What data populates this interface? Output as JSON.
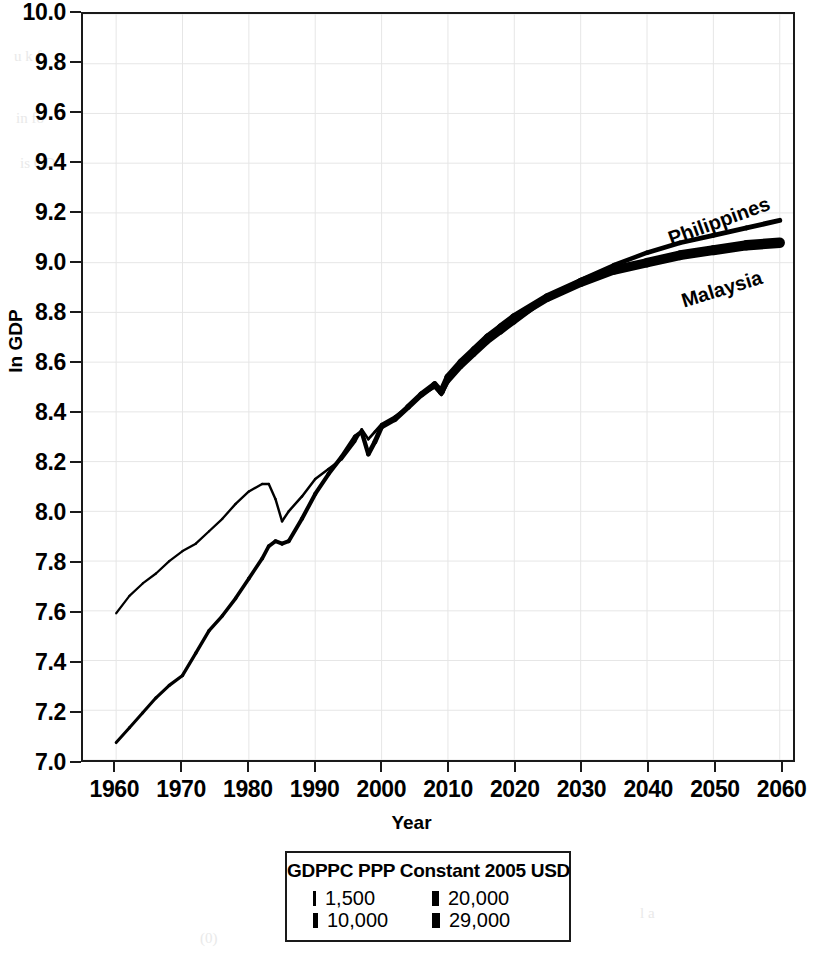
{
  "chart_data": {
    "type": "line",
    "title": "",
    "xlabel": "Year",
    "ylabel": "ln GDP",
    "xlim": [
      1955,
      2062
    ],
    "ylim": [
      7.0,
      10.0
    ],
    "grid": true,
    "legend_position": "below-plot",
    "x_ticks": [
      1960,
      1970,
      1980,
      1990,
      2000,
      2010,
      2020,
      2030,
      2040,
      2050,
      2060
    ],
    "y_ticks": [
      7.0,
      7.2,
      7.4,
      7.6,
      7.8,
      8.0,
      8.2,
      8.4,
      8.6,
      8.8,
      9.0,
      9.2,
      9.4,
      9.6,
      9.8,
      10.0
    ],
    "x": [
      1960,
      1962,
      1964,
      1966,
      1968,
      1970,
      1972,
      1974,
      1976,
      1978,
      1980,
      1982,
      1983,
      1984,
      1985,
      1986,
      1988,
      1990,
      1992,
      1994,
      1996,
      1997,
      1998,
      1999,
      2000,
      2002,
      2004,
      2006,
      2008,
      2009,
      2010,
      2012,
      2014,
      2016,
      2018,
      2020,
      2025,
      2030,
      2035,
      2040,
      2045,
      2050,
      2055,
      2060
    ],
    "series": [
      {
        "name": "Philippines",
        "line_width": "thin",
        "values": [
          7.59,
          7.66,
          7.71,
          7.75,
          7.8,
          7.84,
          7.87,
          7.92,
          7.97,
          8.03,
          8.08,
          8.11,
          8.11,
          8.05,
          7.96,
          8.0,
          8.06,
          8.13,
          8.17,
          8.21,
          8.28,
          8.33,
          8.29,
          8.32,
          8.35,
          8.38,
          8.42,
          8.47,
          8.5,
          8.47,
          8.52,
          8.58,
          8.63,
          8.68,
          8.72,
          8.76,
          8.86,
          8.93,
          8.99,
          9.04,
          9.08,
          9.11,
          9.14,
          9.17
        ]
      },
      {
        "name": "Malaysia",
        "line_width": "thick",
        "values": [
          7.07,
          7.13,
          7.19,
          7.25,
          7.3,
          7.34,
          7.43,
          7.52,
          7.58,
          7.65,
          7.73,
          7.81,
          7.86,
          7.88,
          7.87,
          7.88,
          7.97,
          8.07,
          8.15,
          8.22,
          8.3,
          8.32,
          8.23,
          8.28,
          8.34,
          8.37,
          8.42,
          8.47,
          8.51,
          8.48,
          8.54,
          8.6,
          8.65,
          8.7,
          8.74,
          8.78,
          8.86,
          8.92,
          8.97,
          9.0,
          9.03,
          9.05,
          9.07,
          9.08
        ]
      }
    ],
    "annotations": [
      {
        "text": "Philippines",
        "x": 2046,
        "y": 9.12
      },
      {
        "text": "Malaysia",
        "x": 2048,
        "y": 8.96
      }
    ],
    "legend": {
      "title": "GDPPC PPP Constant 2005 USD",
      "encoding": "line-width",
      "entries": [
        {
          "label": "1,500",
          "swatch_width_px": 3
        },
        {
          "label": "20,000",
          "swatch_width_px": 7
        },
        {
          "label": "10,000",
          "swatch_width_px": 5
        },
        {
          "label": "29,000",
          "swatch_width_px": 8
        }
      ]
    }
  },
  "axes": {
    "y_title": "ln GDP",
    "x_title": "Year",
    "y_tick_labels": [
      "10.0",
      "9.8",
      "9.6",
      "9.4",
      "9.2",
      "9.0",
      "8.8",
      "8.6",
      "8.4",
      "8.2",
      "8.0",
      "7.8",
      "7.6",
      "7.4",
      "7.2",
      "7.0"
    ],
    "x_tick_labels": [
      "1960",
      "1970",
      "1980",
      "1990",
      "2000",
      "2010",
      "2020",
      "2030",
      "2040",
      "2050",
      "2060"
    ]
  },
  "series_labels": {
    "philippines": "Philippines",
    "malaysia": "Malaysia"
  },
  "legend": {
    "title": "GDPPC PPP Constant 2005 USD",
    "entries": [
      {
        "label": "1,500"
      },
      {
        "label": "20,000"
      },
      {
        "label": "10,000"
      },
      {
        "label": "29,000"
      }
    ]
  },
  "colors": {
    "ink": "#000000",
    "axis": "#1a1a1a",
    "grid": "#e6e6e6",
    "background": "#ffffff"
  }
}
